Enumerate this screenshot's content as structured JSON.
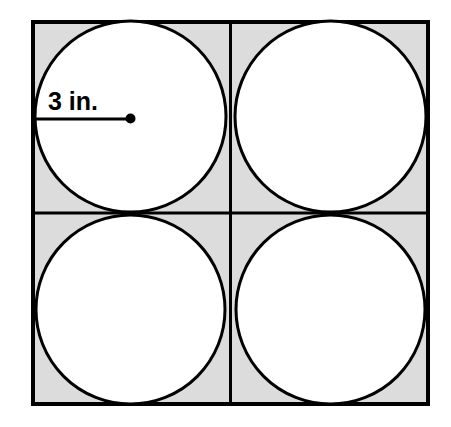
{
  "figure": {
    "background_color": "#ffffff",
    "outer_square": {
      "name": "outer-square",
      "x": 31,
      "y": 20,
      "width": 399,
      "height": 386,
      "fill_color": "#dcdcdc",
      "stroke_color": "#000000",
      "stroke_width": 4
    },
    "dividers": {
      "stroke_color": "#000000",
      "stroke_width": 3,
      "vertical_x": 230.5,
      "horizontal_y": 213
    },
    "circles": [
      {
        "name": "circle-top-left",
        "cx": 130.5,
        "cy": 116.5,
        "r": 97,
        "fill_color": "#ffffff",
        "stroke_color": "#000000",
        "stroke_width": 3
      },
      {
        "name": "circle-top-right",
        "cx": 330.5,
        "cy": 116.5,
        "r": 97,
        "fill_color": "#ffffff",
        "stroke_color": "#000000",
        "stroke_width": 3
      },
      {
        "name": "circle-bottom-left",
        "cx": 130.5,
        "cy": 309.5,
        "r": 96,
        "fill_color": "#ffffff",
        "stroke_color": "#000000",
        "stroke_width": 3
      },
      {
        "name": "circle-bottom-right",
        "cx": 330.5,
        "cy": 309.5,
        "r": 96,
        "fill_color": "#ffffff",
        "stroke_color": "#000000",
        "stroke_width": 3
      }
    ],
    "radius_annotation": {
      "label": "3 in.",
      "value": 3,
      "unit": "in.",
      "label_x": 48,
      "label_y": 110,
      "leader_line": {
        "x1": 33,
        "y1": 119,
        "x2": 130.5,
        "y2": 119,
        "stroke_color": "#000000",
        "stroke_width": 3
      },
      "center_dot": {
        "cx": 130.5,
        "cy": 118.5,
        "r": 5,
        "fill_color": "#000000"
      }
    }
  }
}
